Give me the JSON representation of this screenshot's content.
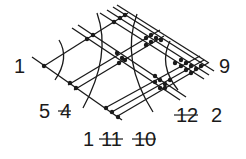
{
  "diagram": {
    "colors": {
      "ink": "#1a1a1a",
      "background": "#ffffff"
    },
    "lines_down_right": [
      {
        "x1": 32,
        "y1": 57,
        "x2": 122,
        "y2": 120
      },
      {
        "x1": 72,
        "y1": 28,
        "x2": 180,
        "y2": 100
      },
      {
        "x1": 78,
        "y1": 25,
        "x2": 186,
        "y2": 97
      },
      {
        "x1": 100,
        "y1": 13,
        "x2": 204,
        "y2": 79
      },
      {
        "x1": 107,
        "y1": 10,
        "x2": 209,
        "y2": 75
      },
      {
        "x1": 113,
        "y1": 7,
        "x2": 214,
        "y2": 71
      },
      {
        "x1": 117,
        "y1": 5,
        "x2": 209,
        "y2": 63
      }
    ],
    "lines_up_right": [
      {
        "x1": 44,
        "y1": 66,
        "x2": 128,
        "y2": 13
      },
      {
        "x1": 68,
        "y1": 85,
        "x2": 160,
        "y2": 30
      },
      {
        "x1": 74,
        "y1": 90,
        "x2": 164,
        "y2": 36
      },
      {
        "x1": 105,
        "y1": 108,
        "x2": 200,
        "y2": 56
      },
      {
        "x1": 110,
        "y1": 113,
        "x2": 204,
        "y2": 60
      },
      {
        "x1": 116,
        "y1": 117,
        "x2": 208,
        "y2": 63
      }
    ],
    "arcs": [
      {
        "d": "M 59 40 Q 70 58 55 80"
      },
      {
        "d": "M 97 13 Q 112 55 83 108"
      },
      {
        "d": "M 137 14 Q 120 60 153 112"
      },
      {
        "d": "M 170 41 Q 158 65 178 90"
      }
    ],
    "dots": [
      [
        44,
        66
      ],
      [
        70,
        83
      ],
      [
        76,
        88
      ],
      [
        87,
        39
      ],
      [
        93,
        35
      ],
      [
        114,
        22
      ],
      [
        120,
        18
      ],
      [
        125,
        15
      ],
      [
        117,
        53
      ],
      [
        122,
        58
      ],
      [
        119,
        63
      ],
      [
        125,
        60
      ],
      [
        146,
        38
      ],
      [
        151,
        35
      ],
      [
        156,
        38
      ],
      [
        151,
        42
      ],
      [
        146,
        45
      ],
      [
        161,
        40
      ],
      [
        175,
        63
      ],
      [
        181,
        60
      ],
      [
        186,
        63
      ],
      [
        191,
        66
      ],
      [
        196,
        69
      ],
      [
        201,
        66
      ],
      [
        186,
        70
      ],
      [
        191,
        73
      ],
      [
        181,
        66
      ],
      [
        155,
        76
      ],
      [
        160,
        80
      ],
      [
        165,
        84
      ],
      [
        160,
        88
      ],
      [
        155,
        82
      ],
      [
        170,
        80
      ],
      [
        165,
        88
      ],
      [
        106,
        108
      ],
      [
        112,
        112
      ],
      [
        118,
        117
      ]
    ],
    "labels": [
      {
        "id": "label-1-left",
        "text": "1",
        "x": 14,
        "y": 73,
        "struck": false
      },
      {
        "id": "label-9",
        "text": "9",
        "x": 219,
        "y": 73,
        "struck": false
      },
      {
        "id": "label-5",
        "text": "5",
        "x": 39,
        "y": 118,
        "struck": false
      },
      {
        "id": "label-4",
        "text": "4",
        "x": 60,
        "y": 118,
        "struck": true
      },
      {
        "id": "label-12",
        "text": "12",
        "x": 176,
        "y": 122,
        "struck": true
      },
      {
        "id": "label-2",
        "text": "2",
        "x": 211,
        "y": 122,
        "struck": false
      },
      {
        "id": "label-1-bottom",
        "text": "1",
        "x": 83,
        "y": 146,
        "struck": false
      },
      {
        "id": "label-11",
        "text": "11",
        "x": 101,
        "y": 146,
        "struck": true
      },
      {
        "id": "label-10",
        "text": "10",
        "x": 134,
        "y": 146,
        "struck": true
      }
    ]
  }
}
